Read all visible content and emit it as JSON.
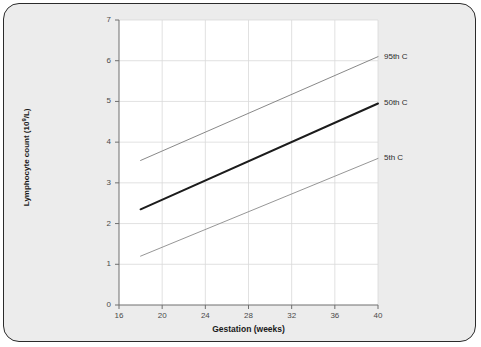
{
  "chart_data": {
    "type": "line",
    "title": "",
    "xlabel": "Gestation (weeks)",
    "ylabel": "Lymphocyte count (10⁹/L)",
    "ylabel_prefix": "Lymphocyte count (10",
    "ylabel_exponent": "9",
    "ylabel_suffix": "/L)",
    "xlim": [
      16,
      40
    ],
    "ylim": [
      0,
      7
    ],
    "xticks": [
      16,
      20,
      24,
      28,
      32,
      36,
      40
    ],
    "yticks": [
      0,
      1,
      2,
      3,
      4,
      5,
      6,
      7
    ],
    "grid": true,
    "legend_position": "right-inline",
    "x": [
      18,
      40
    ],
    "series": [
      {
        "name": "95th C",
        "label": "95th C",
        "values": [
          3.55,
          6.1
        ],
        "color": "#7a7a7a",
        "width": 0.9
      },
      {
        "name": "50th C",
        "label": "50th C",
        "values": [
          2.35,
          4.95
        ],
        "color": "#1c1c1c",
        "width": 2.0
      },
      {
        "name": "5th C",
        "label": "5th C",
        "values": [
          1.2,
          3.6
        ],
        "color": "#8a8a8a",
        "width": 0.9
      }
    ]
  },
  "figure": {
    "background": "#ececec",
    "panel_background": "#ffffff",
    "border_color": "#2b2b2b",
    "grid_color": "#d9d9d9",
    "axis_color": "#6f6f6f"
  }
}
